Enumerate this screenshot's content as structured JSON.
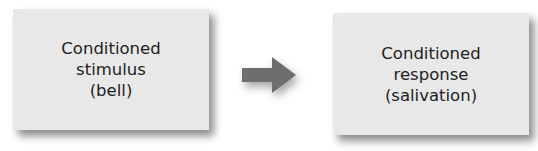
{
  "diagram": {
    "type": "flow",
    "nodes": [
      {
        "id": "conditioned-stimulus",
        "lines": [
          "Conditioned",
          "stimulus",
          "(bell)"
        ]
      },
      {
        "id": "conditioned-response",
        "lines": [
          "Conditioned",
          "response",
          "(salivation)"
        ]
      }
    ],
    "edges": [
      {
        "from": "conditioned-stimulus",
        "to": "conditioned-response",
        "icon": "right-arrow-icon"
      }
    ],
    "colors": {
      "box_fill": "#e8e8e8",
      "text": "#222222",
      "arrow": "#6e6e6e"
    }
  }
}
